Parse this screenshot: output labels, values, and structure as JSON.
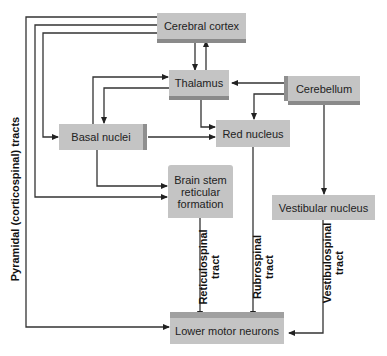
{
  "diagram": {
    "nodes": {
      "cerebral_cortex": "Cerebral cortex",
      "thalamus": "Thalamus",
      "cerebellum": "Cerebellum",
      "basal_nuclei": "Basal nuclei",
      "red_nucleus": "Red nucleus",
      "brain_stem_line1": "Brain stem",
      "brain_stem_line2": "reticular",
      "brain_stem_line3": "formation",
      "vestibular_nucleus": "Vestibular nucleus",
      "lower_motor_neurons": "Lower motor neurons"
    },
    "tract_labels": {
      "pyramidal": "Pyramidal (corticospinal) tracts",
      "reticulospinal_1": "Reticulospinal",
      "reticulospinal_2": "tract",
      "rubrospinal_1": "Rubrospinal",
      "rubrospinal_2": "tract",
      "vestibulospinal_1": "Vestibulospinal",
      "vestibulospinal_2": "tract"
    },
    "edges": [
      {
        "from": "Cerebral cortex",
        "to": "Thalamus"
      },
      {
        "from": "Thalamus",
        "to": "Cerebral cortex"
      },
      {
        "from": "Cerebral cortex",
        "to": "Basal nuclei"
      },
      {
        "from": "Cerebral cortex",
        "to": "Brain stem reticular formation"
      },
      {
        "from": "Cerebral cortex",
        "to": "Lower motor neurons",
        "label": "Pyramidal (corticospinal) tracts"
      },
      {
        "from": "Basal nuclei",
        "to": "Thalamus"
      },
      {
        "from": "Thalamus",
        "to": "Basal nuclei"
      },
      {
        "from": "Cerebellum",
        "to": "Thalamus"
      },
      {
        "from": "Cerebellum",
        "to": "Red nucleus"
      },
      {
        "from": "Thalamus",
        "to": "Red nucleus"
      },
      {
        "from": "Basal nuclei",
        "to": "Red nucleus"
      },
      {
        "from": "Basal nuclei",
        "to": "Brain stem reticular formation"
      },
      {
        "from": "Cerebellum",
        "to": "Vestibular nucleus"
      },
      {
        "from": "Brain stem reticular formation",
        "to": "Lower motor neurons",
        "label": "Reticulospinal tract"
      },
      {
        "from": "Red nucleus",
        "to": "Lower motor neurons",
        "label": "Rubrospinal tract"
      },
      {
        "from": "Vestibular nucleus",
        "to": "Lower motor neurons",
        "label": "Vestibulospinal tract"
      }
    ],
    "colors": {
      "box_fill": "#c4c4c4",
      "box_shadow": "#8a8a8a",
      "line": "#333333"
    }
  }
}
